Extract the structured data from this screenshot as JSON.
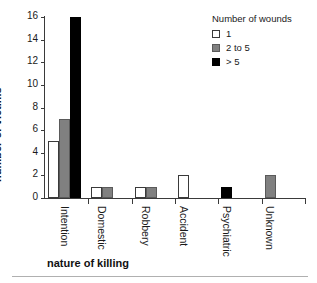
{
  "chart_data": {
    "type": "bar",
    "title": "",
    "xlabel": "nature of killing",
    "ylabel": "number of victims",
    "ylim": [
      0,
      16
    ],
    "yticks": [
      0,
      2,
      4,
      6,
      8,
      10,
      12,
      14,
      16
    ],
    "grid": false,
    "legend_position": "top-right",
    "legend_title": "Number of wounds",
    "categories": [
      "Intention",
      "Domestic",
      "Robbery",
      "Accident",
      "Psychiatric",
      "Unknown"
    ],
    "series": [
      {
        "name": "1",
        "color": "#ffffff",
        "values": [
          5,
          1,
          1,
          2,
          0,
          0
        ]
      },
      {
        "name": "2 to 5",
        "color": "#808080",
        "values": [
          7,
          1,
          1,
          0,
          0,
          2
        ]
      },
      {
        "name": "> 5",
        "color": "#000000",
        "values": [
          16,
          0,
          0,
          0,
          1,
          0
        ]
      }
    ]
  },
  "colors": {
    "axis": "#3a3a3a",
    "text": "#1a1a1a",
    "rule": "#b0b0b0",
    "series_1": "#ffffff",
    "series_2": "#808080",
    "series_3": "#000000"
  }
}
